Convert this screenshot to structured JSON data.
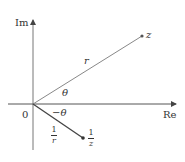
{
  "diagram": {
    "axes": {
      "vertical_label": "Im",
      "horizontal_label": "Re",
      "origin_label": "0"
    },
    "points": {
      "z_label": "z",
      "inverse_num": "1",
      "inverse_den": "z"
    },
    "segments": {
      "r_label": "r",
      "inv_r_num": "1",
      "inv_r_den": "r"
    },
    "angles": {
      "theta_label": "θ",
      "neg_theta_label": "−θ"
    },
    "colors": {
      "axis": "#555555",
      "segment": "#666666",
      "inverse_segment": "#444444",
      "text": "#333333"
    }
  }
}
